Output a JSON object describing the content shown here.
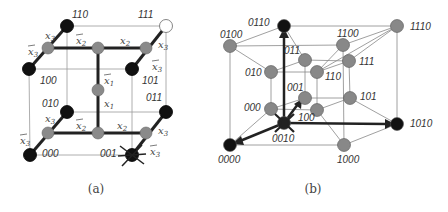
{
  "figure_a": {
    "caption": "(a)",
    "nodes": [
      {
        "label": "110",
        "x": 67,
        "y": 26,
        "fill": "#111111",
        "lx": 72,
        "ly": 18
      },
      {
        "label": "111",
        "x": 166,
        "y": 26,
        "fill": "#ffffff",
        "lx": 138,
        "ly": 18
      },
      {
        "label": "100",
        "x": 29,
        "y": 69,
        "fill": "#111111",
        "lx": 40,
        "ly": 84
      },
      {
        "label": "101",
        "x": 132,
        "y": 69,
        "fill": "#111111",
        "lx": 142,
        "ly": 84
      },
      {
        "label": "010",
        "x": 67,
        "y": 112,
        "fill": "#111111",
        "lx": 42,
        "ly": 107
      },
      {
        "label": "011",
        "x": 166,
        "y": 112,
        "fill": "#111111",
        "lx": 146,
        "ly": 101
      },
      {
        "label": "000",
        "x": 30,
        "y": 155,
        "fill": "#111111",
        "lx": 42,
        "ly": 157
      },
      {
        "label": "001",
        "x": 132,
        "y": 155,
        "fill": "#111111",
        "lx": 100,
        "ly": 157
      }
    ],
    "mid_nodes": [
      {
        "x": 48,
        "y": 48
      },
      {
        "x": 98,
        "y": 48
      },
      {
        "x": 146,
        "y": 48
      },
      {
        "x": 98,
        "y": 90
      },
      {
        "x": 48,
        "y": 133
      },
      {
        "x": 98,
        "y": 133
      },
      {
        "x": 146,
        "y": 133
      }
    ],
    "variable_labels": [
      {
        "text": "x3",
        "x": 45,
        "y": 39,
        "bar": false
      },
      {
        "text": "x3",
        "x": 28,
        "y": 55,
        "bar": true
      },
      {
        "text": "x2",
        "x": 76,
        "y": 44,
        "bar": true
      },
      {
        "text": "x2",
        "x": 120,
        "y": 44,
        "bar": false
      },
      {
        "text": "x3",
        "x": 158,
        "y": 48,
        "bar": false
      },
      {
        "text": "x3",
        "x": 152,
        "y": 70,
        "bar": true
      },
      {
        "text": "x1",
        "x": 104,
        "y": 84,
        "bar": true
      },
      {
        "text": "x1",
        "x": 104,
        "y": 107,
        "bar": false
      },
      {
        "text": "x3",
        "x": 45,
        "y": 122,
        "bar": false
      },
      {
        "text": "x3",
        "x": 20,
        "y": 144,
        "bar": true
      },
      {
        "text": "x2",
        "x": 76,
        "y": 129,
        "bar": true
      },
      {
        "text": "x2",
        "x": 117,
        "y": 129,
        "bar": false
      },
      {
        "text": "x3",
        "x": 158,
        "y": 134,
        "bar": false
      },
      {
        "text": "x3",
        "x": 150,
        "y": 155,
        "bar": true
      }
    ],
    "marked_node": "001"
  },
  "figure_b": {
    "caption": "(b)",
    "nodes": [
      {
        "label": "0110",
        "x": 284,
        "y": 26,
        "fill": "#111111",
        "lx": 248,
        "ly": 26
      },
      {
        "label": "1110",
        "x": 397,
        "y": 26,
        "fill": "#888888",
        "lx": 410,
        "ly": 30
      },
      {
        "label": "0100",
        "x": 230,
        "y": 46,
        "fill": "#888888",
        "lx": 220,
        "ly": 38
      },
      {
        "label": "1100",
        "x": 343,
        "y": 45,
        "fill": "#888888",
        "lx": 337,
        "ly": 37
      },
      {
        "label": "011",
        "x": 305,
        "y": 60,
        "fill": "#888888",
        "lx": 284,
        "ly": 54
      },
      {
        "label": "111",
        "x": 349,
        "y": 61,
        "fill": "#888888",
        "lx": 359,
        "ly": 65
      },
      {
        "label": "010",
        "x": 271,
        "y": 72,
        "fill": "#888888",
        "lx": 245,
        "ly": 76
      },
      {
        "label": "110",
        "x": 317,
        "y": 72,
        "fill": "#888888",
        "lx": 325,
        "ly": 80
      },
      {
        "label": "001",
        "x": 305,
        "y": 98,
        "fill": "#888888",
        "lx": 287,
        "ly": 91
      },
      {
        "label": "101",
        "x": 350,
        "y": 98,
        "fill": "#888888",
        "lx": 360,
        "ly": 100
      },
      {
        "label": "000",
        "x": 271,
        "y": 109,
        "fill": "#888888",
        "lx": 244,
        "ly": 111
      },
      {
        "label": "100",
        "x": 317,
        "y": 110,
        "fill": "#888888",
        "lx": 298,
        "ly": 121
      },
      {
        "label": "0010",
        "x": 284,
        "y": 123,
        "fill": "#222222",
        "lx": 272,
        "ly": 142
      },
      {
        "label": "1010",
        "x": 397,
        "y": 124,
        "fill": "#111111",
        "lx": 410,
        "ly": 127
      },
      {
        "label": "0000",
        "x": 230,
        "y": 145,
        "fill": "#111111",
        "lx": 218,
        "ly": 163
      },
      {
        "label": "1000",
        "x": 344,
        "y": 145,
        "fill": "#888888",
        "lx": 337,
        "ly": 163
      }
    ],
    "marked_node": "0010"
  }
}
